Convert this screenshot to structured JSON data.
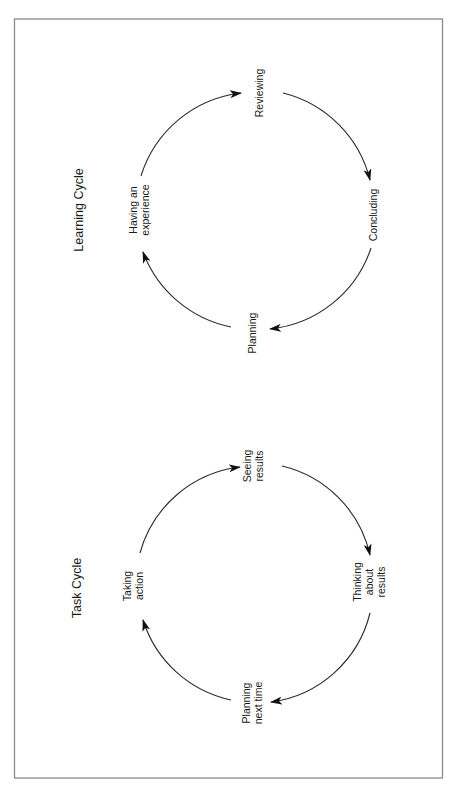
{
  "colors": {
    "frame": "#8a8a8a",
    "arc": "#2a2a2a",
    "text": "#1a1a1a",
    "background": "#ffffff"
  },
  "orientation": "rotated -90deg (text reads bottom-to-top)",
  "learning_cycle": {
    "title": "Learning Cycle",
    "stages": [
      {
        "id": "having-an-experience",
        "lines": [
          "Having an",
          "experience"
        ]
      },
      {
        "id": "reviewing",
        "lines": [
          "Reviewing"
        ]
      },
      {
        "id": "concluding",
        "lines": [
          "Concluding"
        ]
      },
      {
        "id": "planning",
        "lines": [
          "Planning"
        ]
      }
    ],
    "flow": [
      "Having an experience",
      "Reviewing",
      "Concluding",
      "Planning",
      "Having an experience"
    ]
  },
  "task_cycle": {
    "title": "Task Cycle",
    "stages": [
      {
        "id": "taking-action",
        "lines": [
          "Taking",
          "action"
        ]
      },
      {
        "id": "seeing-results",
        "lines": [
          "Seeing",
          "results"
        ]
      },
      {
        "id": "thinking-about-results",
        "lines": [
          "Thinking",
          "about",
          "results"
        ]
      },
      {
        "id": "planning-next-time",
        "lines": [
          "Planning",
          "next time"
        ]
      }
    ],
    "flow": [
      "Taking action",
      "Seeing results",
      "Thinking about results",
      "Planning next time",
      "Taking action"
    ]
  }
}
